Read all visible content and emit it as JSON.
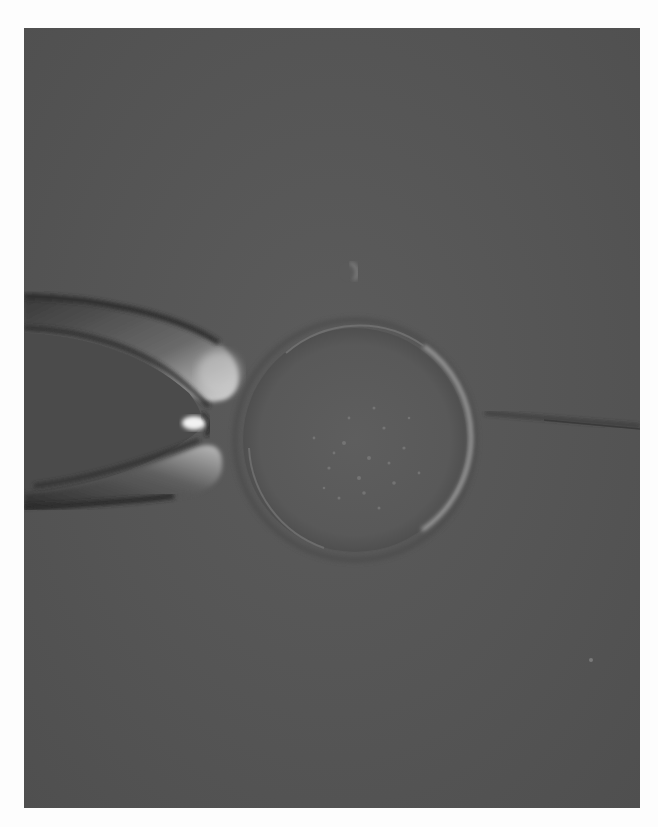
{
  "image": {
    "subject": "oocyte held by holding pipette with injection needle (microscopy)",
    "background_color": "#555555",
    "frame": {
      "left": 24,
      "top": 28,
      "width": 616,
      "height": 780
    },
    "page_background": "#fdfdfd"
  },
  "elements": {
    "oocyte": {
      "cx": 331,
      "cy": 412,
      "r": 112,
      "fill": "#585858",
      "rim": "#a0a0a0"
    },
    "polar_body": {
      "cx": 324,
      "cy": 244,
      "r": 10
    },
    "holding_pipette": {
      "tip_x": 185,
      "tip_y": 395
    },
    "injection_needle": {
      "x1": 461,
      "y1": 385,
      "x2": 616,
      "y2": 398
    },
    "speck": {
      "cx": 567,
      "cy": 632,
      "r": 2
    }
  }
}
